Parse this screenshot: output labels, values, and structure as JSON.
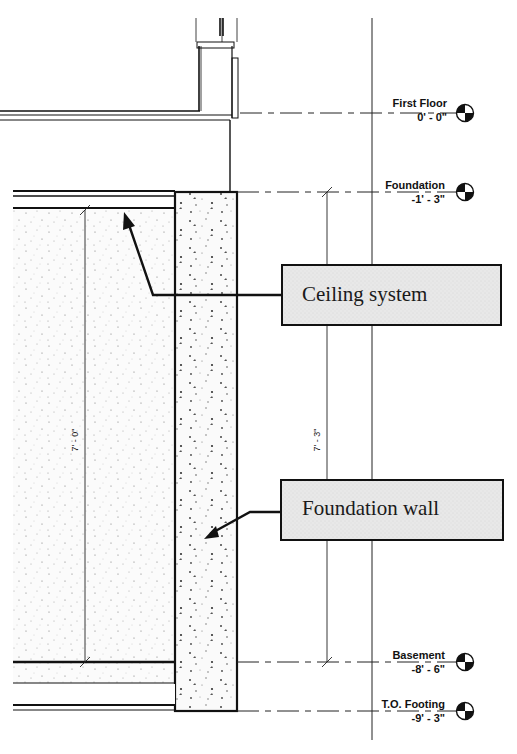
{
  "drawing": {
    "type": "wall section",
    "levels": [
      {
        "name": "First Floor",
        "elevation": "0' - 0\"",
        "y": 113
      },
      {
        "name": "Foundation",
        "elevation": "-1' - 3\"",
        "y": 192
      },
      {
        "name": "Basement",
        "elevation": "-8' - 6\"",
        "y": 662
      },
      {
        "name": "T.O. Footing",
        "elevation": "-9' - 3\"",
        "y": 711
      }
    ],
    "dimensions": [
      {
        "label": "7' - 0\"",
        "orientation": "vertical"
      },
      {
        "label": "7' - 3\"",
        "orientation": "vertical"
      }
    ],
    "callouts": [
      {
        "label": "Ceiling system"
      },
      {
        "label": "Foundation wall"
      }
    ],
    "colors": {
      "line": "#111111",
      "callout_fill": "#e6e6e6",
      "background": "#ffffff"
    }
  }
}
